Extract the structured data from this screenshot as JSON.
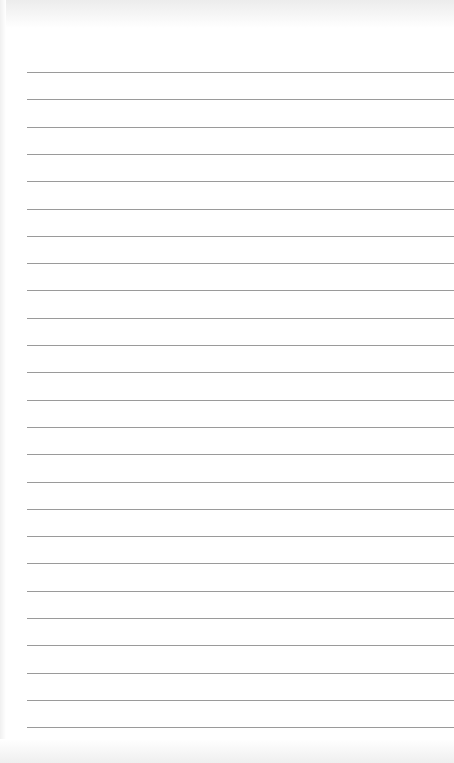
{
  "paper": {
    "background": "#ffffff",
    "line_color": "#9a9a9a",
    "line_count": 25,
    "first_line_y": 72,
    "line_spacing": 27.3,
    "line_left": 27
  }
}
